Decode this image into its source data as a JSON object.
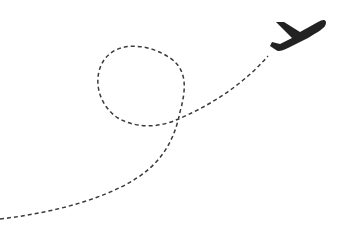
{
  "illustration": {
    "subject": "airplane-flight-path",
    "colors": {
      "background": "#ffffff",
      "path": "#3a3a3a",
      "plane": "#222222"
    },
    "path": {
      "style": "dashed",
      "dash": "4 3",
      "stroke_width": 1.5
    }
  }
}
